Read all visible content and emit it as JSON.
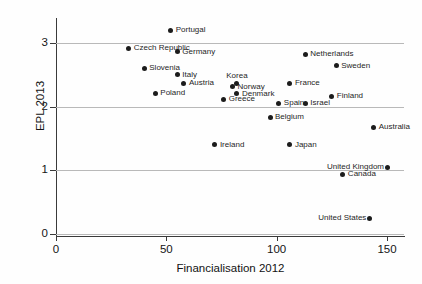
{
  "chart_data": {
    "type": "scatter",
    "title": "",
    "xlabel": "Financialisation 2012",
    "ylabel": "EPL 2013",
    "xlim": [
      0,
      157
    ],
    "ylim": [
      0,
      3.3
    ],
    "xticks": [
      0,
      50,
      100,
      150
    ],
    "yticks": [
      0,
      1,
      2,
      3
    ],
    "xticklabels": [
      "0",
      "50",
      "100",
      "150"
    ],
    "yticklabels": [
      "0",
      "1",
      "2",
      "3"
    ],
    "grid": "horizontal",
    "legend": "none",
    "points": [
      {
        "label": "Portugal",
        "x": 52,
        "y": 3.2,
        "pos": "right"
      },
      {
        "label": "Czech Republic",
        "x": 33,
        "y": 2.92,
        "pos": "right"
      },
      {
        "label": "Germany",
        "x": 55,
        "y": 2.86,
        "pos": "right"
      },
      {
        "label": "Netherlands",
        "x": 113,
        "y": 2.82,
        "pos": "right"
      },
      {
        "label": "Sweden",
        "x": 127,
        "y": 2.64,
        "pos": "right"
      },
      {
        "label": "Slovenia",
        "x": 40,
        "y": 2.6,
        "pos": "right"
      },
      {
        "label": "Italy",
        "x": 55,
        "y": 2.5,
        "pos": "right"
      },
      {
        "label": "Korea",
        "x": 82,
        "y": 2.37,
        "pos": "above"
      },
      {
        "label": "Austria",
        "x": 58,
        "y": 2.37,
        "pos": "right"
      },
      {
        "label": "France",
        "x": 106,
        "y": 2.37,
        "pos": "right"
      },
      {
        "label": "Norway",
        "x": 80,
        "y": 2.31,
        "pos": "right"
      },
      {
        "label": "Poland",
        "x": 45,
        "y": 2.21,
        "pos": "right"
      },
      {
        "label": "Denmark",
        "x": 82,
        "y": 2.2,
        "pos": "right"
      },
      {
        "label": "Finland",
        "x": 125,
        "y": 2.16,
        "pos": "right"
      },
      {
        "label": "Greece",
        "x": 76,
        "y": 2.12,
        "pos": "right"
      },
      {
        "label": "Spain",
        "x": 101,
        "y": 2.05,
        "pos": "right"
      },
      {
        "label": "Israel",
        "x": 113,
        "y": 2.05,
        "pos": "right"
      },
      {
        "label": "Belgium",
        "x": 97,
        "y": 1.83,
        "pos": "right"
      },
      {
        "label": "Australia",
        "x": 144,
        "y": 1.68,
        "pos": "right"
      },
      {
        "label": "Ireland",
        "x": 72,
        "y": 1.4,
        "pos": "right"
      },
      {
        "label": "Japan",
        "x": 106,
        "y": 1.4,
        "pos": "right"
      },
      {
        "label": "United Kingdom",
        "x": 150,
        "y": 1.05,
        "pos": "left"
      },
      {
        "label": "Canada",
        "x": 130,
        "y": 0.94,
        "pos": "right"
      },
      {
        "label": "United States",
        "x": 142,
        "y": 0.25,
        "pos": "left"
      }
    ]
  },
  "colors": {
    "marker": "#1c1c1c",
    "grid": "#b9b9b9",
    "axis": "#3a3a3a",
    "text": "#161616",
    "background": "#fefefe"
  }
}
